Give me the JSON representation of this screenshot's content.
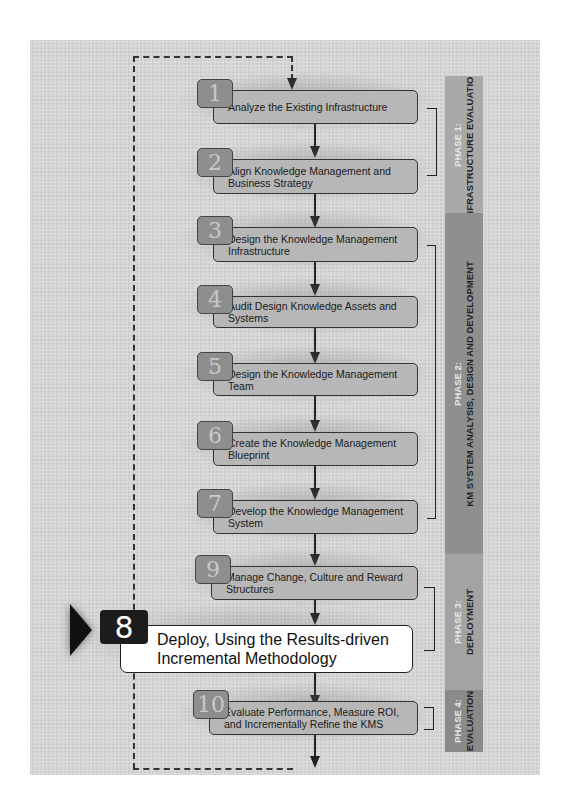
{
  "diagram": {
    "steps": [
      {
        "number": "1",
        "label": "Analyze the Existing Infrastructure",
        "phase": 1
      },
      {
        "number": "2",
        "label": "Align Knowledge Management and Business Strategy",
        "phase": 1
      },
      {
        "number": "3",
        "label": "Design the Knowledge Management Infrastructure",
        "phase": 2
      },
      {
        "number": "4",
        "label": "Audit Design Knowledge Assets and Systems",
        "phase": 2
      },
      {
        "number": "5",
        "label": "Design the Knowledge Management Team",
        "phase": 2
      },
      {
        "number": "6",
        "label": "Create the Knowledge Management Blueprint",
        "phase": 2
      },
      {
        "number": "7",
        "label": "Develop the Knowledge Management System",
        "phase": 2
      },
      {
        "number": "9",
        "label": "Manage Change, Culture and Reward Structures",
        "phase": 3
      },
      {
        "number": "8",
        "label": "Deploy, Using the Results-driven Incremental Methodology",
        "phase": 3,
        "highlighted": true
      },
      {
        "number": "10",
        "label": "Evaluate Performance, Measure ROI, and Incrementally Refine the KMS",
        "phase": 4
      }
    ],
    "phases": [
      {
        "number_label": "PHASE 1:",
        "name": "INFRASTRUCTURE EVALUATION",
        "color": "#a9a9a9"
      },
      {
        "number_label": "PHASE 2:",
        "name": "KM SYSTEM ANALYSIS, DESIGN AND DEVELOPMENT",
        "color": "#8f8f8f"
      },
      {
        "number_label": "PHASE 3:",
        "name": "DEPLOYMENT",
        "color": "#a3a3a3"
      },
      {
        "number_label": "PHASE 4:",
        "name": "EVALUATION",
        "color": "#8a8a8a"
      }
    ],
    "feedback_loop": "dashed line from step 10 back to step 1"
  }
}
